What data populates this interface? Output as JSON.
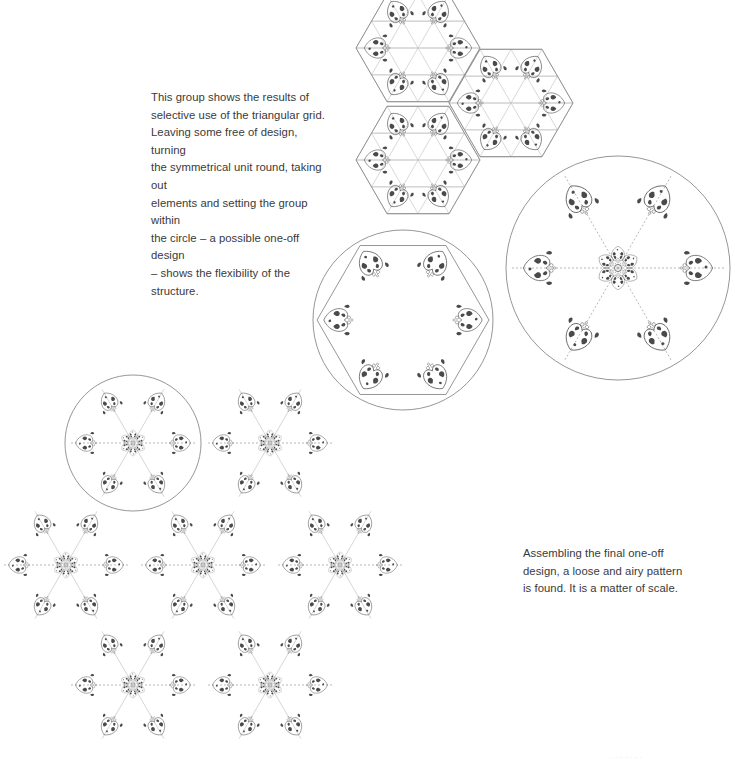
{
  "captions": {
    "top": "This group shows the results of\nselective use of the triangular grid.\nLeaving some free of design, turning\nthe symmetrical unit round, taking out\nelements and setting the group within\nthe circle – a possible one-off design\n– shows the flexibility of the structure.",
    "bottom": "Assembling the final one-off\ndesign, a loose and airy pattern\nis found. It is a matter of scale.",
    "footer": "· ·  · ··  ·· · ·· ·"
  },
  "illustrations": {
    "hex_group": {
      "name": "triangular-grid-hexagon-group",
      "hexagons": 3,
      "motif": "heart-leaf-ornament"
    },
    "star_circle": {
      "name": "six-point-star-in-circle",
      "motifs": 6
    },
    "rosette_circle": {
      "name": "rosette-with-satellites-in-circle",
      "satellites": 6
    },
    "final_pattern": {
      "name": "assembled-one-off-pattern",
      "rosettes": 7,
      "highlight_circle": true
    }
  },
  "colors": {
    "ink": "#4a4a4a",
    "line": "#8a8a8a",
    "grid": "#bdbdbd",
    "text": "#3a3a3a"
  }
}
